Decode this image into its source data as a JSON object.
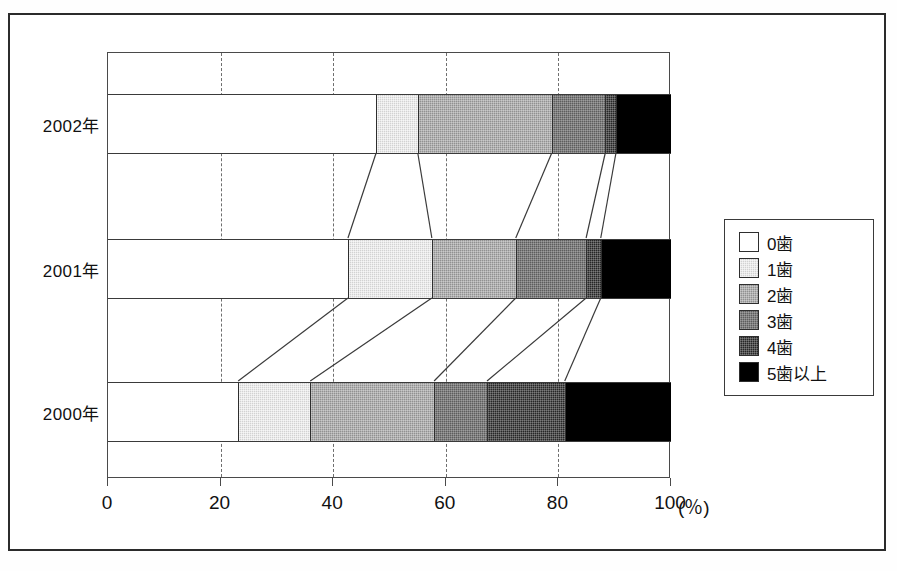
{
  "chart_data": {
    "type": "bar",
    "orientation": "horizontal",
    "stacked": true,
    "stack_mode": "percent",
    "title": "",
    "xlabel": "(%)",
    "ylabel": "",
    "xlim": [
      0,
      100
    ],
    "xticks": [
      0,
      20,
      40,
      60,
      80,
      100
    ],
    "xtick_labels": [
      "0",
      "20",
      "40",
      "60",
      "80",
      "100"
    ],
    "x_unit": "(%)",
    "grid": "dashed vertical gridlines at every 20%",
    "legend_position": "right",
    "categories": [
      "2002年",
      "2001年",
      "2000年"
    ],
    "series": [
      {
        "name": "0歯",
        "color": "#ffffff",
        "values": [
          47.8,
          42.8,
          23.3
        ]
      },
      {
        "name": "1歯",
        "color": "#d2d2d2",
        "values": [
          7.4,
          14.9,
          12.8
        ]
      },
      {
        "name": "2歯",
        "color": "#919191",
        "values": [
          23.8,
          14.9,
          22.0
        ]
      },
      {
        "name": "3歯",
        "color": "#5d5d5d",
        "values": [
          9.5,
          12.5,
          9.4
        ]
      },
      {
        "name": "4歯",
        "color": "#262626",
        "values": [
          1.9,
          2.6,
          13.8
        ]
      },
      {
        "name": "5歯以上",
        "color": "#000000",
        "values": [
          9.6,
          12.3,
          18.7
        ]
      }
    ],
    "cumulative_boundaries": {
      "2002年": [
        47.8,
        55.2,
        79.0,
        88.5,
        90.4,
        100.0
      ],
      "2001年": [
        42.8,
        57.7,
        72.6,
        85.1,
        87.7,
        100.0
      ],
      "2000年": [
        23.3,
        36.1,
        58.1,
        67.5,
        81.3,
        100.0
      ]
    }
  },
  "legend": {
    "items": [
      {
        "label": "0歯",
        "fill": "f0"
      },
      {
        "label": "1歯",
        "fill": "f1"
      },
      {
        "label": "2歯",
        "fill": "f2"
      },
      {
        "label": "3歯",
        "fill": "f3"
      },
      {
        "label": "4歯",
        "fill": "f4"
      },
      {
        "label": "5歯以上",
        "fill": "f5"
      }
    ]
  },
  "axis": {
    "x_tick_labels": [
      "0",
      "20",
      "40",
      "60",
      "80",
      "100"
    ],
    "x_unit_label": "(％)",
    "y_tick_labels": [
      "2002年",
      "2001年",
      "2000年"
    ]
  },
  "geometry": {
    "plot": {
      "left": 107,
      "top": 52,
      "width": 563,
      "height": 426
    },
    "bars": [
      {
        "category": "2002年",
        "top": 41,
        "height": 60
      },
      {
        "category": "2001年",
        "top": 186,
        "height": 60
      },
      {
        "category": "2000年",
        "top": 329,
        "height": 60
      }
    ]
  }
}
